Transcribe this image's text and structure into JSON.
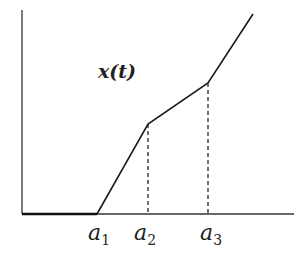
{
  "diagram": {
    "function_label": "x(t)",
    "ticks": [
      {
        "base": "a",
        "sub": "1",
        "x": 97
      },
      {
        "base": "a",
        "sub": "2",
        "x": 148
      },
      {
        "base": "a",
        "sub": "3",
        "x": 208
      }
    ],
    "curve_points": [
      [
        22,
        214
      ],
      [
        97,
        214
      ],
      [
        148,
        124
      ],
      [
        208,
        83
      ],
      [
        253,
        14
      ]
    ],
    "line_color": "#1a1a1a"
  }
}
